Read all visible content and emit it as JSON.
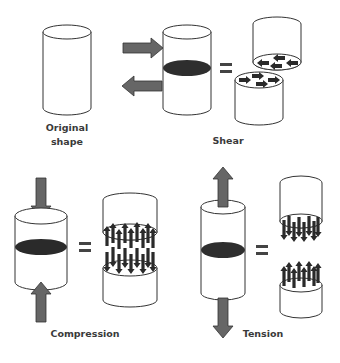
{
  "diagram": {
    "colors": {
      "outline": "#333333",
      "cross_section": "#2e2e2e",
      "force_arrow": "#666666",
      "force_arrow_edge": "#333333",
      "stress_arrow": "#2a2a2a",
      "equals": "#444444",
      "label": "#3a3a3a"
    },
    "panels": [
      {
        "id": "original",
        "label_line1": "Original",
        "label_line2": "shape"
      },
      {
        "id": "shear",
        "label": "Shear",
        "applied_forces": [
          "right (top)",
          "left (bottom)"
        ],
        "result": "two halves with sliding in-plane stress arrows"
      },
      {
        "id": "compression",
        "label": "Compression",
        "applied_forces": [
          "down (top)",
          "up (bottom)"
        ],
        "result": "two halves with arrows pushing into each face"
      },
      {
        "id": "tension",
        "label": "Tension",
        "applied_forces": [
          "up (top)",
          "down (bottom)"
        ],
        "result": "two halves with arrows pulling away from each face"
      }
    ],
    "equals_symbol": "="
  }
}
